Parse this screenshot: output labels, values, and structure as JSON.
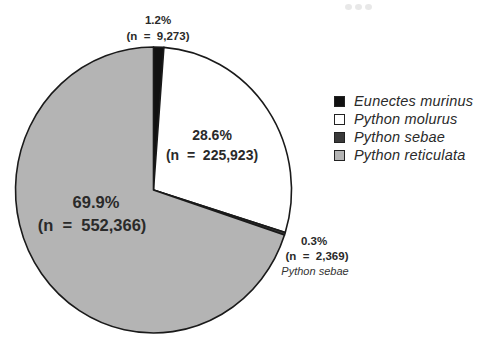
{
  "chart_data": {
    "type": "pie",
    "title": "",
    "start": "top",
    "direction": "clockwise",
    "slices": [
      {
        "name": "Eunectes murinus",
        "percent": 1.2,
        "n": 9273,
        "label_pct": "1.2%",
        "label_n": "(n  =  9,273)",
        "color": "#111111",
        "label_position": "outside-top"
      },
      {
        "name": "Python molurus",
        "percent": 28.6,
        "n": 225923,
        "label_pct": "28.6%",
        "label_n": "(n  =  225,923)",
        "color": "#ffffff",
        "label_position": "inside"
      },
      {
        "name": "Python sebae",
        "percent": 0.3,
        "n": 2369,
        "label_pct": "0.3%",
        "label_n": "(n  =  2,369)",
        "label_sub": "Python sebae",
        "color": "#3a3a3a",
        "label_position": "outside-right"
      },
      {
        "name": "Python reticulata",
        "percent": 69.9,
        "n": 552366,
        "label_pct": "69.9%",
        "label_n": "(n  =  552,366)",
        "color": "#b4b4b4",
        "label_position": "inside"
      }
    ],
    "legend": {
      "placement": "right",
      "entries": [
        "Eunectes murinus",
        "Python molurus",
        "Python sebae",
        "Python reticulata"
      ]
    }
  }
}
